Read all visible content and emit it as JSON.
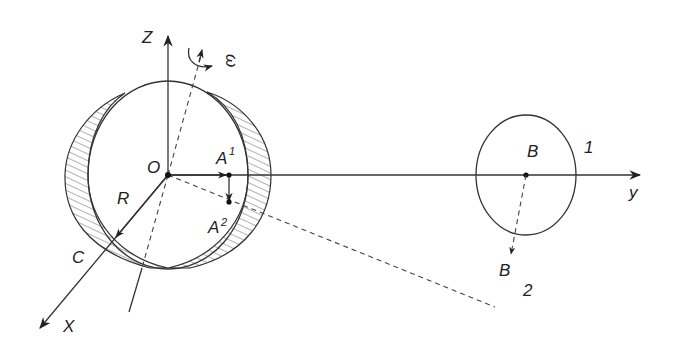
{
  "diagram": {
    "type": "physics-schematic",
    "axes": {
      "z_label": "Z",
      "y_label": "y",
      "x_label": "X"
    },
    "labels": {
      "origin": "O",
      "omega": "ω",
      "radius": "R",
      "point_c": "C",
      "a1_base": "A",
      "a1_sup": "1",
      "a2_base": "A",
      "a2_sup": "2",
      "b_upper": "B",
      "b_lower": "B",
      "position_1": "1",
      "position_2": "2"
    },
    "colors": {
      "line": "#333333",
      "hatch": "#555555",
      "background": "#ffffff"
    }
  }
}
